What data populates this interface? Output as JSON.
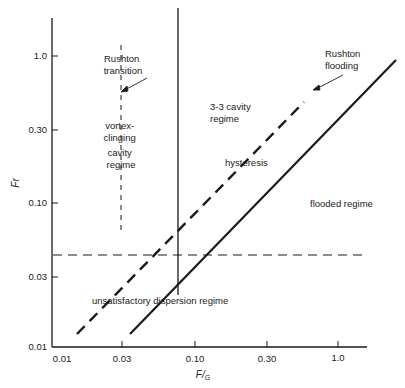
{
  "figure": {
    "y_axis": {
      "label": "Fr",
      "ticks": [
        "1.0",
        "0.30",
        "0.10",
        "0.03",
        "0.01"
      ]
    },
    "x_axis": {
      "label_main": "F/",
      "label_sub": "G",
      "ticks": [
        "0.01",
        "0.03",
        "0.10",
        "0.30",
        "1.0"
      ]
    },
    "regions": {
      "rushton_transition": [
        "Rushton",
        "transition"
      ],
      "vortex_clinging": [
        "vortex-",
        "clinging",
        "cavity",
        "regime"
      ],
      "three_three_cavity": [
        "3-3 cavity",
        "regime"
      ],
      "rushton_flooding": [
        "Rushton",
        "flooding"
      ],
      "hysteresis": "hysteresis",
      "flooded": "flooded regime",
      "unsatisfactory": "unsatisfactory dispersion regime"
    },
    "colors": {
      "ink": "#1a1a1a",
      "background": "#ffffff"
    }
  }
}
